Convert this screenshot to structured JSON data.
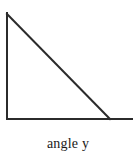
{
  "figure": {
    "caption": "angle y",
    "background_color": "#ffffff",
    "stroke_color": "#2b2b2b",
    "stroke_width": 2,
    "canvas": {
      "width": 136,
      "height": 156
    }
  },
  "chart_data": {
    "type": "diagram",
    "title": "angle y",
    "shape": "right-triangle",
    "vertices": {
      "top_left": [
        7,
        13
      ],
      "bottom_left": [
        7,
        119
      ],
      "bottom_right": [
        110,
        119
      ]
    },
    "segments": [
      {
        "name": "vertical-leg",
        "from": [
          7,
          13
        ],
        "to": [
          7,
          119
        ]
      },
      {
        "name": "horizontal-leg",
        "from": [
          7,
          119
        ],
        "to": [
          132,
          119
        ]
      },
      {
        "name": "hypotenuse",
        "from": [
          7,
          14
        ],
        "to": [
          110,
          119
        ]
      }
    ],
    "right_angle_at": "bottom_left",
    "labels": [
      {
        "text": "angle y",
        "position": "below-figure",
        "x": 68,
        "y": 146
      }
    ],
    "grid": false,
    "legend": false
  }
}
